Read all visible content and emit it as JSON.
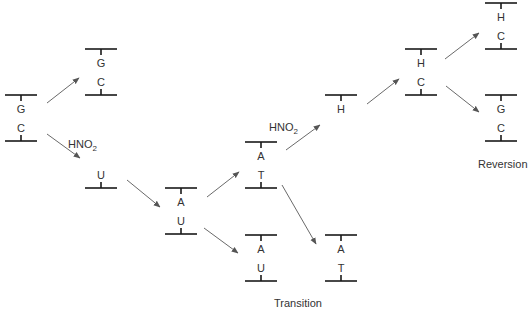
{
  "colors": {
    "bar": "#1a1a1a",
    "arrow": "#6a6a6a",
    "text": "#333333"
  },
  "nodes": [
    {
      "id": "gc-start",
      "x": 21,
      "top": 95,
      "bottom": 141,
      "bases": [
        "G",
        "C"
      ]
    },
    {
      "id": "gc-copy",
      "x": 101,
      "top": 49,
      "bottom": 95,
      "bases": [
        "G",
        "C"
      ]
    },
    {
      "id": "u-strand",
      "x": 101,
      "top": null,
      "bottom": 188,
      "bases": [
        "U"
      ]
    },
    {
      "id": "au-1",
      "x": 181,
      "top": 188,
      "bottom": 234,
      "bases": [
        "A",
        "U"
      ]
    },
    {
      "id": "at-1",
      "x": 261,
      "top": 142,
      "bottom": 188,
      "bases": [
        "A",
        "T"
      ]
    },
    {
      "id": "au-2",
      "x": 261,
      "top": 235,
      "bottom": 281,
      "bases": [
        "A",
        "U"
      ]
    },
    {
      "id": "at-2",
      "x": 341,
      "top": 235,
      "bottom": 281,
      "bases": [
        "A",
        "T"
      ]
    },
    {
      "id": "h-strand",
      "x": 341,
      "top": 95,
      "bottom": null,
      "bases": [
        "H"
      ]
    },
    {
      "id": "hc-1",
      "x": 421,
      "top": 49,
      "bottom": 95,
      "bases": [
        "H",
        "C"
      ]
    },
    {
      "id": "hc-2",
      "x": 501,
      "top": 3,
      "bottom": 49,
      "bases": [
        "H",
        "C"
      ]
    },
    {
      "id": "gc-rev",
      "x": 501,
      "top": 95,
      "bottom": 141,
      "bases": [
        "G",
        "C"
      ]
    }
  ],
  "arrows": [
    {
      "from": "gc-start",
      "to": "gc-copy",
      "x1": 47,
      "y1": 103,
      "x2": 79,
      "y2": 78
    },
    {
      "from": "gc-start",
      "to": "u-strand",
      "x1": 47,
      "y1": 134,
      "x2": 80,
      "y2": 158
    },
    {
      "from": "u-strand",
      "to": "au-1",
      "x1": 127,
      "y1": 180,
      "x2": 160,
      "y2": 207
    },
    {
      "from": "au-1",
      "to": "at-1",
      "x1": 207,
      "y1": 197,
      "x2": 239,
      "y2": 172
    },
    {
      "from": "au-1",
      "to": "au-2",
      "x1": 204,
      "y1": 228,
      "x2": 238,
      "y2": 253
    },
    {
      "from": "at-1",
      "to": "h-strand",
      "x1": 286,
      "y1": 150,
      "x2": 320,
      "y2": 125
    },
    {
      "from": "at-1",
      "to": "at-2",
      "x1": 282,
      "y1": 185,
      "x2": 316,
      "y2": 244
    },
    {
      "from": "h-strand",
      "to": "hc-1",
      "x1": 367,
      "y1": 104,
      "x2": 399,
      "y2": 79
    },
    {
      "from": "hc-1",
      "to": "hc-2",
      "x1": 445,
      "y1": 59,
      "x2": 479,
      "y2": 33
    },
    {
      "from": "hc-1",
      "to": "gc-rev",
      "x1": 446,
      "y1": 86,
      "x2": 479,
      "y2": 112
    }
  ],
  "labels": {
    "hno2_first": "HNO2",
    "hno2_second": "HNO2",
    "transition": "Transition",
    "reversion": "Reversion"
  }
}
